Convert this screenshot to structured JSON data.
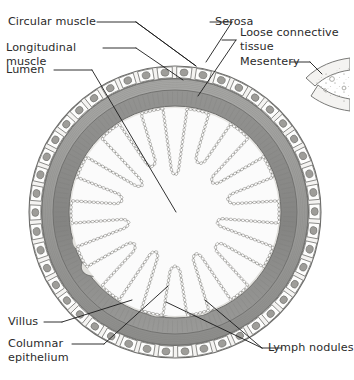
{
  "figure": {
    "type": "anatomical-cross-section",
    "background_color": "#ffffff",
    "line_color": "#1a1a1a",
    "text_color": "#2b2b2b"
  },
  "labels": {
    "circular_muscle": "Circular muscle",
    "longitudinal_muscle_l1": "Longitudinal",
    "longitudinal_muscle_l2": "muscle",
    "lumen": "Lumen",
    "serosa": "Serosa",
    "loose_connective_tissue_l1": "Loose connective",
    "loose_connective_tissue_l2": "tissue",
    "mesentery": "Mesentery",
    "villus": "Villus",
    "columnar_epithelium_l1": "Columnar",
    "columnar_epithelium_l2": "epithelium",
    "lymph_nodules": "Lymph nodules"
  },
  "structure": {
    "layers": [
      {
        "name": "serosa",
        "fill": "#f2f1ef",
        "description": "outermost squamous cell layer"
      },
      {
        "name": "longitudinal-muscle",
        "fill": "#9b9b99",
        "description": "outer muscle band"
      },
      {
        "name": "circular-muscle",
        "fill": "#8e8e8c",
        "description": "inner muscle band"
      },
      {
        "name": "submucosa",
        "fill": "#e6e5e2",
        "description": "loose connective tissue"
      },
      {
        "name": "mucosa-villi",
        "fill": "#fafafa",
        "description": "villi projecting into lumen"
      },
      {
        "name": "lumen",
        "fill": "#ffffff",
        "description": "central cavity"
      }
    ],
    "villi_count": 14,
    "lymph_nodule_count": 4,
    "serosa_cell_count": 46,
    "center": {
      "x": 175,
      "y": 212
    },
    "outer_radius": 147
  },
  "colors": {
    "serosa_fill": "#f2f1ef",
    "muscle_outer": "#9d9d9b",
    "muscle_inner": "#8a8a88",
    "submucosa": "#e7e6e3",
    "villi_fill": "#fbfbfb",
    "lumen": "#ffffff",
    "nodule_fill": "#e3e2de",
    "outline": "#6e6e6c",
    "mesentery_fill": "#f4f3f1"
  }
}
